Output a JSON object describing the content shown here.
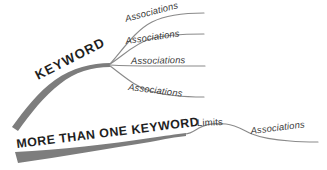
{
  "canvas": {
    "width": 327,
    "height": 170,
    "background": "#ffffff"
  },
  "colors": {
    "thick_branch": "#7d7d7d",
    "thin_branch": "#8a8a8a",
    "text_dark": "#1f1f1f",
    "text_label": "#3a3a3a"
  },
  "diagram": {
    "type": "mind-map",
    "primary_branch": {
      "label": "KEYWORD",
      "style": "thick-tapered-curve",
      "color": "#7d7d7d"
    },
    "secondary_branch": {
      "label": "MORE THAN ONE KEYWORD",
      "style": "thick-tapered-wedge",
      "color": "#7d7d7d"
    },
    "sub_branches": [
      {
        "label": "Associations",
        "index": 1,
        "position": "top"
      },
      {
        "label": "Associations",
        "index": 2,
        "position": "upper-middle"
      },
      {
        "label": "Associations",
        "index": 3,
        "position": "lower-middle"
      },
      {
        "label": "Associations",
        "index": 4,
        "position": "bottom"
      }
    ],
    "lower_branches": [
      {
        "label": "Limits",
        "index": 1,
        "position": "hump"
      },
      {
        "label": "Associations",
        "index": 2,
        "position": "tail"
      }
    ]
  }
}
